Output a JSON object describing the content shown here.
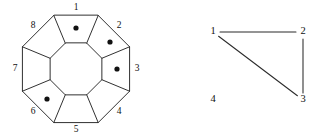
{
  "figure": {
    "background_color": "#ffffff",
    "line_color": "#1a1a1a",
    "dot_color": "#111111",
    "width": 322,
    "height": 140
  },
  "left_diagram": {
    "name": "octagonal-tiling-diagram",
    "shape": "octagon",
    "center": {
      "x": 76,
      "y": 69
    },
    "outer_radius": 58,
    "inner_radius": 28,
    "sector_count": 8,
    "sector_labels": [
      "1",
      "2",
      "3",
      "4",
      "5",
      "6",
      "7",
      "8"
    ],
    "sector_label_positions": [
      {
        "label": "1",
        "x": 76,
        "y": 8
      },
      {
        "label": "2",
        "x": 119,
        "y": 26
      },
      {
        "label": "3",
        "x": 137,
        "y": 69
      },
      {
        "label": "4",
        "x": 119,
        "y": 112
      },
      {
        "label": "5",
        "x": 76,
        "y": 130
      },
      {
        "label": "6",
        "x": 33,
        "y": 112
      },
      {
        "label": "7",
        "x": 15,
        "y": 69
      },
      {
        "label": "8",
        "x": 33,
        "y": 26
      }
    ],
    "marked_sectors": [
      "1",
      "2",
      "3",
      "6"
    ],
    "dot_radius": 2.6,
    "dot_positions": [
      {
        "sector": "1",
        "x": 76,
        "y": 28
      },
      {
        "sector": "2",
        "x": 110,
        "y": 42
      },
      {
        "sector": "3",
        "x": 117,
        "y": 69
      },
      {
        "sector": "6",
        "x": 47,
        "y": 99
      }
    ]
  },
  "right_diagram": {
    "name": "vertex-graph",
    "vertices": [
      {
        "id": "1",
        "x": 213,
        "y": 32
      },
      {
        "id": "2",
        "x": 303,
        "y": 32
      },
      {
        "id": "3",
        "x": 303,
        "y": 100
      },
      {
        "id": "4",
        "x": 213,
        "y": 100
      }
    ],
    "edges": [
      {
        "from": "1",
        "to": "2"
      },
      {
        "from": "2",
        "to": "3"
      },
      {
        "from": "1",
        "to": "3"
      }
    ],
    "isolated_vertices": [
      "4"
    ]
  }
}
